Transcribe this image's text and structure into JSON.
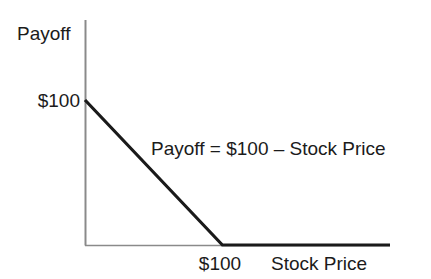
{
  "chart_data": {
    "type": "line",
    "title": "",
    "subtitle": "",
    "xlabel": "Stock Price",
    "ylabel": "Payoff",
    "xlim": [
      0,
      222
    ],
    "ylim": [
      0,
      145
    ],
    "grid": false,
    "legend": "none",
    "annotations": [
      {
        "text": "Payoff = $100 – Stock Price",
        "x": 100,
        "y": 70
      }
    ],
    "xticks": [
      {
        "value": 100,
        "label": "$100"
      }
    ],
    "yticks": [
      {
        "value": 100,
        "label": "$100"
      }
    ],
    "series": [
      {
        "name": "Payoff = $100 – Stock Price",
        "color": "#1a1a1a",
        "x": [
          0,
          100,
          222
        ],
        "values": [
          100,
          0,
          0
        ]
      }
    ]
  },
  "axes": {
    "y_axis_title": "Payoff",
    "x_axis_title": "Stock Price",
    "y_tick_label": "$100",
    "x_tick_label": "$100"
  },
  "annotation": {
    "equation": "Payoff = $100 – Stock Price"
  },
  "colors": {
    "background": "#ffffff",
    "axis": "#8a8a8a",
    "payoff_line": "#1a1a1a",
    "text": "#1b1b1b"
  }
}
